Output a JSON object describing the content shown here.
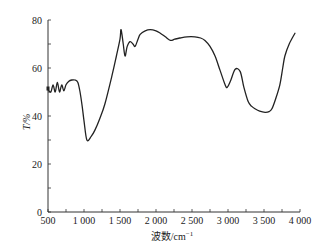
{
  "chart_data": {
    "type": "line",
    "title": "",
    "xlabel": "波数/cm⁻¹",
    "xlabel_main": "波数/cm",
    "xlabel_sup": "−1",
    "ylabel": "T/%",
    "xlim": [
      500,
      4000
    ],
    "ylim": [
      0,
      80
    ],
    "grid": false,
    "legend": null,
    "x_ticks": [
      500,
      1000,
      1500,
      2000,
      2500,
      3000,
      3500,
      4000
    ],
    "x_tick_labels": [
      "500",
      "1 000",
      "1 500",
      "2 000",
      "2 500",
      "3 000",
      "3 500",
      "4 000"
    ],
    "y_ticks": [
      0,
      20,
      40,
      60,
      80
    ],
    "y_tick_labels": [
      "0",
      "20",
      "40",
      "60",
      "80"
    ],
    "series": [
      {
        "name": "T",
        "x": [
          500,
          540,
          570,
          600,
          630,
          660,
          690,
          720,
          750,
          790,
          830,
          875,
          915,
          945,
          975,
          1000,
          1040,
          1100,
          1150,
          1220,
          1290,
          1390,
          1450,
          1500,
          1515,
          1545,
          1570,
          1600,
          1640,
          1680,
          1710,
          1750,
          1780,
          1850,
          1920,
          2000,
          2060,
          2130,
          2200,
          2260,
          2330,
          2430,
          2540,
          2620,
          2680,
          2750,
          2820,
          2890,
          2960,
          2990,
          3040,
          3100,
          3170,
          3220,
          3280,
          3330,
          3375,
          3440,
          3515,
          3570,
          3610,
          3660,
          3720,
          3760,
          3790,
          3850,
          3930
        ],
        "values": [
          51,
          50,
          53,
          50,
          54,
          50,
          53,
          50.5,
          53,
          54.5,
          55,
          55,
          54,
          50,
          44,
          38,
          30,
          31.5,
          34,
          39,
          45,
          57,
          65,
          72,
          76,
          70,
          65,
          69,
          71,
          70,
          69,
          72,
          74,
          75.5,
          76,
          75.5,
          74.5,
          73,
          71.5,
          72,
          72.5,
          73,
          73,
          72.5,
          71.5,
          69,
          65,
          59,
          53,
          52,
          55,
          59.5,
          58.5,
          52,
          46,
          44,
          43,
          42,
          41.5,
          41.8,
          43,
          47,
          53,
          60,
          65,
          70,
          74.5
        ]
      }
    ]
  }
}
